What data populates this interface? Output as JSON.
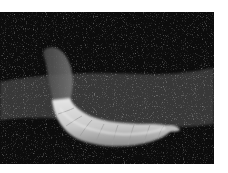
{
  "image": {
    "subject": "pale segmented larva on dark soil",
    "colors": {
      "background": "#ffffff",
      "soil_dark": "#0c0c0c",
      "soil_band": "#3a3a3a",
      "larva_light": "#d8d8d8",
      "larva_shadow": "#9a9a9a"
    }
  }
}
